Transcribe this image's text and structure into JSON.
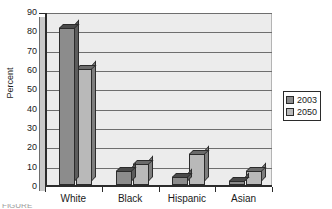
{
  "chart_data": {
    "type": "bar",
    "title": "",
    "subtitle": "",
    "xlabel": "",
    "ylabel": "Percent",
    "categories": [
      "White",
      "Black",
      "Hispanic",
      "Asian"
    ],
    "series": [
      {
        "name": "2003",
        "values": [
          81,
          7,
          4,
          2
        ],
        "color": "#8c8c8c"
      },
      {
        "name": "2050",
        "values": [
          60,
          11,
          16,
          7
        ],
        "color": "#b9b9b9"
      }
    ],
    "ylim": [
      0,
      90
    ],
    "ytick_step": 10,
    "yticks": [
      0,
      10,
      20,
      30,
      40,
      50,
      60,
      70,
      80,
      90
    ],
    "ytick_labels": [
      "0",
      "10",
      "20",
      "30",
      "40",
      "50",
      "60",
      "70",
      "80",
      "90"
    ],
    "grid": true,
    "grid_axis": "y",
    "legend_position": "right",
    "style": "3d-clustered-column",
    "plot_background": "#ececec",
    "axis_color": "#2b2b2b",
    "grid_color": "#6e6e6e"
  },
  "legend": {
    "entries": [
      {
        "label": "2003",
        "swatch": "#8c8c8c"
      },
      {
        "label": "2050",
        "swatch": "#b9b9b9"
      }
    ]
  },
  "axes": {
    "y_title": "Percent"
  },
  "caption": {
    "text": "FIGURE"
  }
}
